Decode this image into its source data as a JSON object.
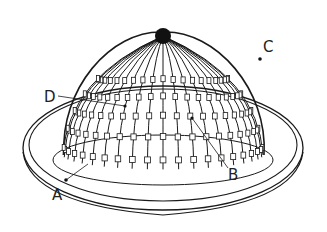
{
  "figure": {
    "colors": {
      "ink": "#1a1a1a",
      "background": "#ffffff"
    },
    "rib_count": 40,
    "labels": [
      {
        "id": "A",
        "text": "A",
        "target": "base ring edge"
      },
      {
        "id": "B",
        "text": "B",
        "target": "dome rib segment"
      },
      {
        "id": "C",
        "text": "C",
        "target": "outer base ring"
      },
      {
        "id": "D",
        "text": "D",
        "target": "dome rib block"
      }
    ]
  }
}
